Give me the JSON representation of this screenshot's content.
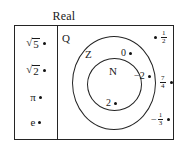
{
  "diagram": {
    "title": "Real",
    "type": "nested-set-venn-diagram",
    "regions": {
      "irrational_column": {
        "items": [
          {
            "label": "√5",
            "radicand": "5",
            "has_point": true
          },
          {
            "label": "√2",
            "radicand": "2",
            "has_point": true
          },
          {
            "label": "π",
            "has_point": true
          },
          {
            "label": "e",
            "has_point": true
          }
        ]
      },
      "rational": {
        "label": "Q",
        "integers": {
          "label": "Z"
        },
        "naturals": {
          "label": "N"
        }
      }
    },
    "elements": [
      {
        "name": "zero",
        "label": "0",
        "region": "Z",
        "point": true
      },
      {
        "name": "two",
        "label": "2",
        "region": "N",
        "point": true
      },
      {
        "name": "negative-two",
        "label": "−2",
        "region": "Z",
        "point": true
      },
      {
        "name": "one-half",
        "numerator": "1",
        "denominator": "2",
        "sign": "",
        "region": "Q",
        "point": true
      },
      {
        "name": "seven-fourths",
        "numerator": "7",
        "denominator": "4",
        "sign": "",
        "region": "Q",
        "point": true
      },
      {
        "name": "negative-one-third",
        "numerator": "1",
        "denominator": "3",
        "sign": "−",
        "region": "Q",
        "point": true
      }
    ],
    "colors": {
      "stroke": "#242424",
      "text": "#1a1a1a",
      "background": "#ffffff"
    }
  }
}
